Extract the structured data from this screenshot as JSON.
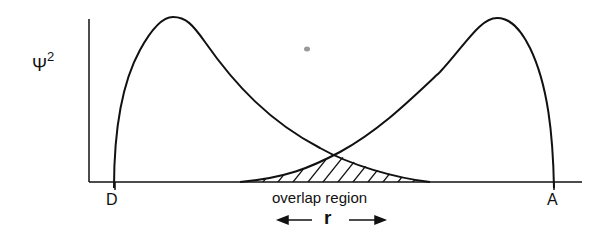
{
  "diagram": {
    "y_axis_label": "Ψ",
    "y_axis_superscript": "2",
    "donor_label": "D",
    "acceptor_label": "A",
    "overlap_label": "overlap region",
    "distance_label": "r"
  },
  "colors": {
    "stroke": "#111111",
    "background": "#ffffff",
    "dot": "#999999"
  }
}
